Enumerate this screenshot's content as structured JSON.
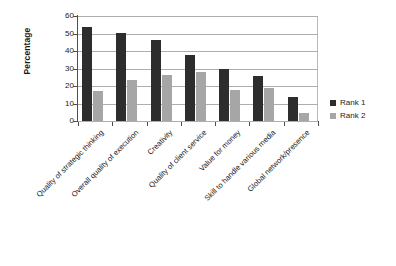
{
  "chart_data": {
    "type": "bar",
    "title": "",
    "xlabel": "",
    "ylabel": "Percentage",
    "ylim": [
      0,
      60
    ],
    "yticks": [
      0,
      10,
      20,
      30,
      40,
      50,
      60
    ],
    "grid": true,
    "legend_position": "right",
    "categories": [
      "Quality of strategic thinking",
      "Overall quality of execution",
      "Creativity",
      "Quality of client service",
      "Value for money",
      "Skill to handle various media",
      "Global network/presence"
    ],
    "series": [
      {
        "name": "Rank 1",
        "color": "#2d2d2d",
        "values": [
          54,
          50.5,
          46.5,
          37.5,
          30,
          25.5,
          13.5
        ]
      },
      {
        "name": "Rank 2",
        "color": "#a6a6a6",
        "values": [
          17,
          23.5,
          26.5,
          28,
          17.5,
          19,
          4.5
        ]
      }
    ]
  },
  "axis": {
    "y_title": "Percentage",
    "y_tick_labels": [
      "60",
      "50",
      "40",
      "30",
      "20",
      "10",
      "0"
    ]
  },
  "legend": {
    "items": [
      {
        "label": "Rank 1",
        "color": "#2d2d2d"
      },
      {
        "label": "Rank 2",
        "color": "#a6a6a6"
      }
    ]
  }
}
